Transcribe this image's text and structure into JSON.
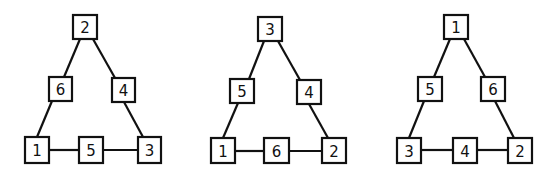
{
  "diagram": {
    "triangles": [
      {
        "top": "2",
        "left_mid": "6",
        "right_mid": "4",
        "bottom_left": "1",
        "bottom_mid": "5",
        "bottom_right": "3"
      },
      {
        "top": "3",
        "left_mid": "5",
        "right_mid": "4",
        "bottom_left": "1",
        "bottom_mid": "6",
        "bottom_right": "2"
      },
      {
        "top": "1",
        "left_mid": "5",
        "right_mid": "6",
        "bottom_left": "3",
        "bottom_mid": "4",
        "bottom_right": "2"
      }
    ]
  }
}
